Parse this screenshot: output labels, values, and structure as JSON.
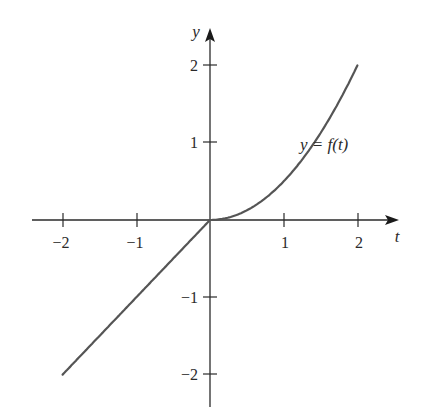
{
  "chart_data": {
    "type": "line",
    "title": "",
    "xlabel": "t",
    "ylabel": "y",
    "xlim": [
      -2.0,
      2.5
    ],
    "ylim": [
      -2.35,
      2.35
    ],
    "x_ticks": [
      -2,
      -1,
      1,
      2
    ],
    "y_ticks": [
      -2,
      -1,
      1,
      2
    ],
    "x_tick_labels": [
      "−2",
      "−1",
      "1",
      "2"
    ],
    "y_tick_labels": [
      "−2",
      "−1",
      "1",
      "2"
    ],
    "grid": false,
    "legend": null,
    "annotations": [
      {
        "text": "y = f(t)",
        "x": 1.55,
        "y": 0.92
      }
    ],
    "series": [
      {
        "name": "y = f(t)",
        "color": "#555555",
        "description": "f(t) = t for t <= 0; f(t) = t^2/2 for t >= 0",
        "x": [
          -2,
          -1.5,
          -1,
          -0.5,
          0,
          0.25,
          0.5,
          0.75,
          1,
          1.25,
          1.5,
          1.75,
          2
        ],
        "y": [
          -2,
          -1.5,
          -1,
          -0.5,
          0,
          0.03125,
          0.125,
          0.28125,
          0.5,
          0.78125,
          1.125,
          1.53125,
          2
        ]
      }
    ]
  },
  "labels": {
    "x_axis": "t",
    "y_axis": "y",
    "curve": "y = f(t)",
    "x_ticks": [
      "−2",
      "−1",
      "1",
      "2"
    ],
    "y_ticks": [
      "2",
      "1",
      "−1",
      "−2"
    ]
  },
  "colors": {
    "axis": "#2a2a2a",
    "curve": "#555555",
    "background": "#ffffff"
  }
}
